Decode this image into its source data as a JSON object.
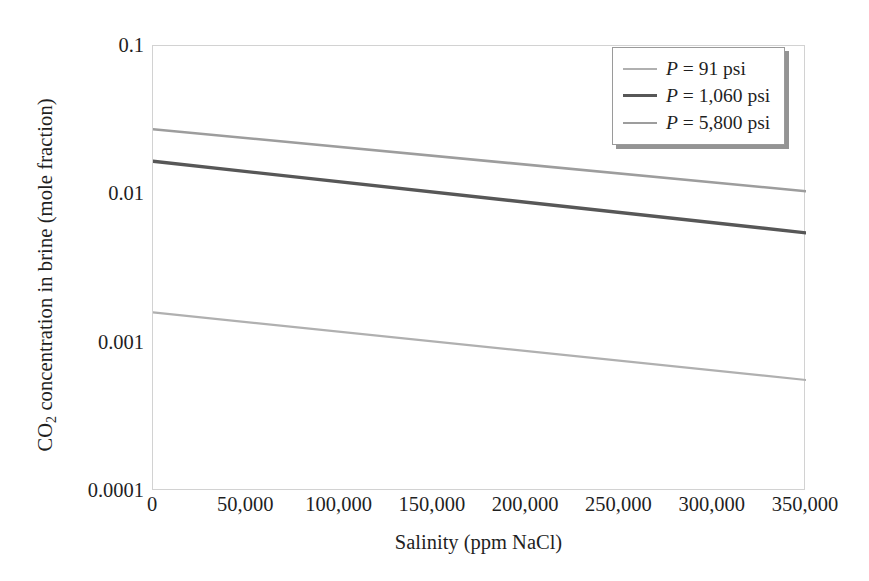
{
  "chart_data": {
    "type": "line",
    "title": "",
    "xlabel": "Salinity (ppm NaCl)",
    "ylabel": "CO2 concentration in brine (mole fraction)",
    "ylabel_parts": {
      "prefix": "CO",
      "sub": "2",
      "suffix": " concentration in brine (mole fraction)"
    },
    "xlim": [
      0,
      350000
    ],
    "ylim": [
      0.0001,
      0.1
    ],
    "yscale": "log",
    "xscale": "linear",
    "grid": false,
    "legend_position": "top-right",
    "xticks": [
      0,
      50000,
      100000,
      150000,
      200000,
      250000,
      300000,
      350000
    ],
    "xticklabels": [
      "0",
      "50,000",
      "100,000",
      "150,000",
      "200,000",
      "250,000",
      "300,000",
      "350,000"
    ],
    "yticks": [
      0.1,
      0.01,
      0.001,
      0.0001
    ],
    "yticklabels": [
      "0.1",
      "0.01",
      "0.001",
      "0.0001"
    ],
    "x": [
      0,
      350000
    ],
    "series": [
      {
        "name": "P = 91 psi",
        "label_prefix": "P",
        "label_suffix": " = 91 psi",
        "color": "#b0b0b0",
        "width": 2.2,
        "values": [
          0.0016,
          0.00056
        ]
      },
      {
        "name": "P = 1,060 psi",
        "label_prefix": "P",
        "label_suffix": " = 1,060 psi",
        "color": "#575757",
        "width": 3.4,
        "values": [
          0.0167,
          0.0055
        ]
      },
      {
        "name": "P = 5,800 psi",
        "label_prefix": "P",
        "label_suffix": " = 5,800 psi",
        "color": "#9d9d9d",
        "width": 2.6,
        "values": [
          0.0275,
          0.0105
        ]
      }
    ],
    "legend_order": [
      "P = 91 psi",
      "P = 1,060 psi",
      "P = 5,800 psi"
    ],
    "frame_color": "#d2d2d2",
    "background": "#ffffff"
  }
}
